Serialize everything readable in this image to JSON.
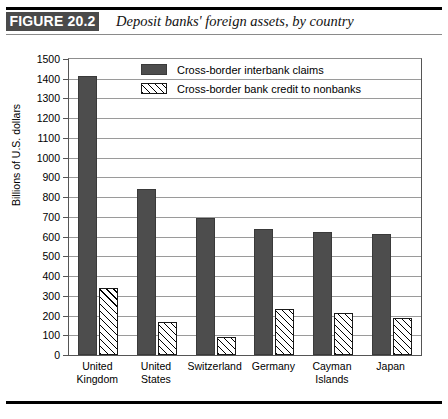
{
  "figure": {
    "badge": "FIGURE 20.2",
    "title": "Deposit banks' foreign assets, by country"
  },
  "chart_data": {
    "type": "bar",
    "title": "Deposit banks' foreign assets, by country",
    "xlabel": "",
    "ylabel": "Billions of U.S. dollars",
    "ylim": [
      0,
      1500
    ],
    "ytick_step": 100,
    "yticks": [
      0,
      100,
      200,
      300,
      400,
      500,
      600,
      700,
      800,
      900,
      1000,
      1100,
      1200,
      1300,
      1400,
      1500
    ],
    "ytick_labels": [
      "0",
      "100",
      "200",
      "300",
      "400",
      "500",
      "600",
      "700",
      "800",
      "900",
      "1000",
      "1100",
      "1200",
      "1300",
      "1400",
      "1500"
    ],
    "grid": true,
    "grid_axis": "y",
    "legend_position": "top-center",
    "categories": [
      "United\nKingdom",
      "United\nStates",
      "Switzerland",
      "Germany",
      "Cayman\nIslands",
      "Japan"
    ],
    "series": [
      {
        "name": "Cross-border interbank claims",
        "style": "solid",
        "color": "#4d4d4d",
        "values": [
          1415,
          840,
          695,
          638,
          625,
          612
        ]
      },
      {
        "name": "Cross-border bank credit to nonbanks",
        "style": "hatch",
        "color": "#ffffff",
        "values": [
          340,
          165,
          90,
          232,
          215,
          190
        ]
      }
    ]
  },
  "legend": {
    "items": [
      {
        "label": "Cross-border interbank claims",
        "style": "solid"
      },
      {
        "label": "Cross-border bank credit to nonbanks",
        "style": "hatch"
      }
    ]
  }
}
